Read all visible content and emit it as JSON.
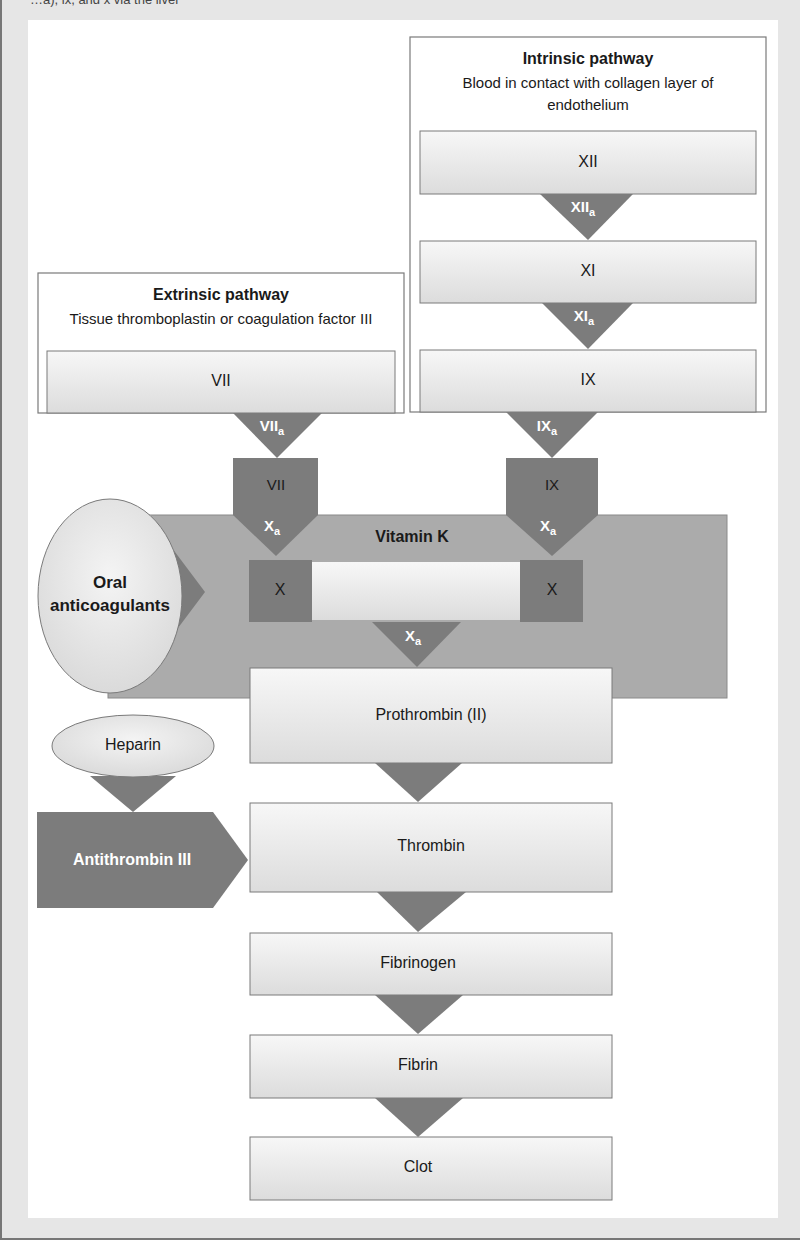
{
  "header_fragment": "…a), ix, and x via the liver",
  "colors": {
    "frame_bg": "#e6e6e6",
    "panel_bg": "#ffffff",
    "box_fill": "#e8e8e8",
    "box_stroke": "#7a7a7a",
    "dark_fill": "#7c7c7c",
    "vitamin_band": "#aaaaaa",
    "text_dark": "#1a1a1a",
    "text_light": "#ffffff"
  },
  "intrinsic": {
    "title": "Intrinsic pathway",
    "subtitle_line1": "Blood in contact with collagen layer of",
    "subtitle_line2": "endothelium",
    "factors": [
      {
        "label": "XII",
        "activated": "XII",
        "sub": "a"
      },
      {
        "label": "XI",
        "activated": "XI",
        "sub": "a"
      },
      {
        "label": "IX",
        "activated": "IX",
        "sub": "a"
      }
    ]
  },
  "extrinsic": {
    "title": "Extrinsic pathway",
    "subtitle": "Tissue thromboplastin or coagulation factor III",
    "factor": {
      "label": "VII",
      "activated": "VII",
      "sub": "a"
    }
  },
  "convergence": {
    "left_arrow": {
      "top": "VII",
      "bottom": "X",
      "sub": "a"
    },
    "right_arrow": {
      "top": "IX",
      "bottom": "X",
      "sub": "a"
    },
    "vitamin_k_label": "Vitamin K",
    "x_left": "X",
    "x_right": "X",
    "xa": {
      "main": "X",
      "sub": "a"
    }
  },
  "inhibitors": {
    "oral_line1": "Oral",
    "oral_line2": "anticoagulants",
    "heparin": "Heparin",
    "antithrombin": "Antithrombin III"
  },
  "common_pathway": [
    {
      "label": "Prothrombin (II)"
    },
    {
      "label": "Thrombin"
    },
    {
      "label": "Fibrinogen"
    },
    {
      "label": "Fibrin"
    },
    {
      "label": "Clot"
    }
  ]
}
